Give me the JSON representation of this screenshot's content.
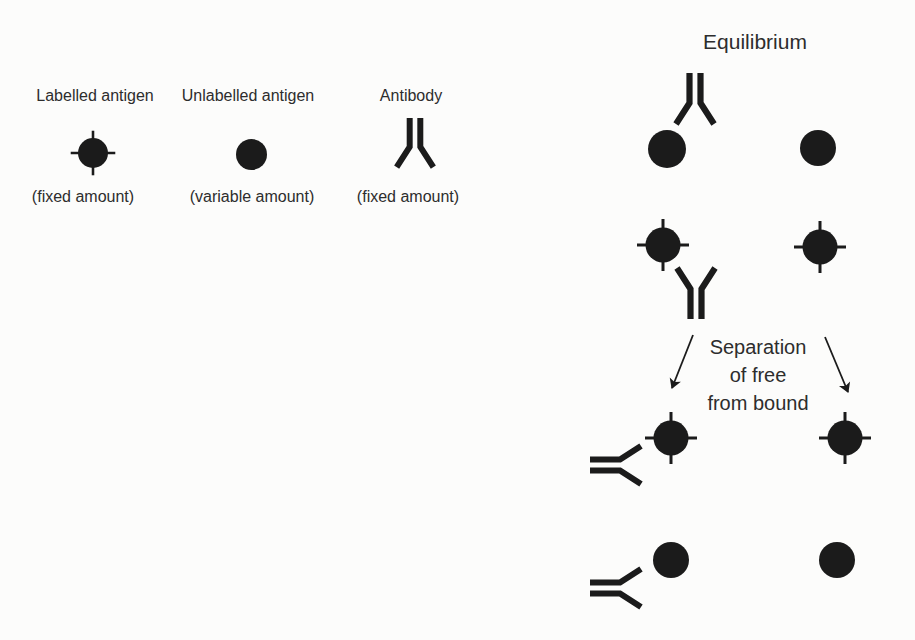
{
  "figure": {
    "background": "#fcfcfb",
    "ink": "#1b1b1b",
    "title": "Equilibrium",
    "legend": [
      {
        "id": "labelled-antigen",
        "icon": "labelled-antigen-icon",
        "label": "Labelled antigen",
        "caption": "(fixed amount)"
      },
      {
        "id": "unlabelled-antigen",
        "icon": "unlabelled-antigen-icon",
        "label": "Unlabelled antigen",
        "caption": "(variable amount)"
      },
      {
        "id": "antibody",
        "icon": "antibody-icon",
        "label": "Antibody",
        "caption": "(fixed amount)"
      }
    ],
    "separation": {
      "lines": [
        "Separation",
        "of free",
        "from bound"
      ]
    }
  }
}
